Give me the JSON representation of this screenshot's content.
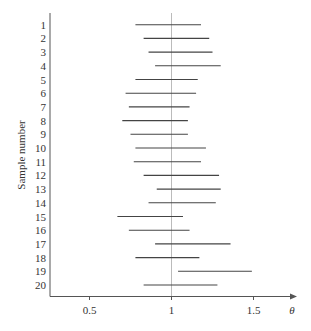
{
  "chart_data": {
    "type": "interval",
    "title": "",
    "xlabel": "θ",
    "ylabel": "Sample number",
    "xlim": [
      0.26,
      1.77
    ],
    "xticks": [
      0.5,
      1,
      1.5
    ],
    "xtick_labels": [
      "0.5",
      "1",
      "1.5"
    ],
    "reference_line": 1,
    "grid": false,
    "legend": null,
    "categories": [
      "1",
      "2",
      "3",
      "4",
      "5",
      "6",
      "7",
      "8",
      "9",
      "10",
      "11",
      "12",
      "13",
      "14",
      "15",
      "16",
      "17",
      "18",
      "19",
      "20"
    ],
    "intervals": [
      {
        "sample": 1,
        "lower": 0.78,
        "upper": 1.18
      },
      {
        "sample": 2,
        "lower": 0.83,
        "upper": 1.23
      },
      {
        "sample": 3,
        "lower": 0.86,
        "upper": 1.25
      },
      {
        "sample": 4,
        "lower": 0.9,
        "upper": 1.3
      },
      {
        "sample": 5,
        "lower": 0.78,
        "upper": 1.16
      },
      {
        "sample": 6,
        "lower": 0.72,
        "upper": 1.15
      },
      {
        "sample": 7,
        "lower": 0.74,
        "upper": 1.11
      },
      {
        "sample": 8,
        "lower": 0.7,
        "upper": 1.1
      },
      {
        "sample": 9,
        "lower": 0.75,
        "upper": 1.1
      },
      {
        "sample": 10,
        "lower": 0.78,
        "upper": 1.21
      },
      {
        "sample": 11,
        "lower": 0.77,
        "upper": 1.18
      },
      {
        "sample": 12,
        "lower": 0.83,
        "upper": 1.29
      },
      {
        "sample": 13,
        "lower": 0.91,
        "upper": 1.3
      },
      {
        "sample": 14,
        "lower": 0.86,
        "upper": 1.27
      },
      {
        "sample": 15,
        "lower": 0.67,
        "upper": 1.07
      },
      {
        "sample": 16,
        "lower": 0.74,
        "upper": 1.11
      },
      {
        "sample": 17,
        "lower": 0.9,
        "upper": 1.36
      },
      {
        "sample": 18,
        "lower": 0.78,
        "upper": 1.17
      },
      {
        "sample": 19,
        "lower": 1.04,
        "upper": 1.49
      },
      {
        "sample": 20,
        "lower": 0.83,
        "upper": 1.28
      }
    ]
  },
  "colors": {
    "interval": "#444444",
    "axis": "#555555",
    "reference": "#aaaaaa",
    "text": "#333333"
  }
}
